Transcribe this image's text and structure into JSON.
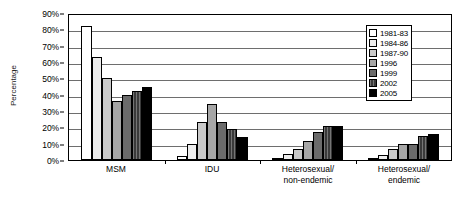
{
  "chart_data": {
    "type": "bar",
    "title": "",
    "xlabel": "",
    "ylabel": "Percentage",
    "ylim": [
      0,
      90
    ],
    "ytick_labels": [
      "90%",
      "80%",
      "70%",
      "60%",
      "50%",
      "40%",
      "30%",
      "20%",
      "10%",
      "0%"
    ],
    "ytick_values": [
      90,
      80,
      70,
      60,
      50,
      40,
      30,
      20,
      10,
      0
    ],
    "grid": true,
    "legend_position": "top-right",
    "categories": [
      "MSM",
      "IDU",
      "Heterosexual/non-endemic",
      "Heterosexual/endemic"
    ],
    "category_lines": [
      [
        "MSM",
        ""
      ],
      [
        "IDU",
        ""
      ],
      [
        "Heterosexual/",
        "non-endemic"
      ],
      [
        "Heterosexual/",
        "endemic"
      ]
    ],
    "series": [
      {
        "name": "1981-83",
        "color": "#ffffff",
        "values": [
          82,
          2.5,
          1,
          1.5
        ]
      },
      {
        "name": "1984-86",
        "color": "#ededed",
        "values": [
          63,
          10,
          3.5,
          3
        ]
      },
      {
        "name": "1987-90",
        "color": "#c9c9c9",
        "values": [
          50,
          23.5,
          6.5,
          6.5
        ]
      },
      {
        "name": "1996",
        "color": "#a6a6a6",
        "values": [
          36,
          34,
          11.5,
          10
        ]
      },
      {
        "name": "1999",
        "color": "#6b6b6b",
        "values": [
          40,
          23,
          17,
          10
        ]
      },
      {
        "name": "2002",
        "color": "#3a3a3a",
        "values": [
          42,
          19,
          21,
          14.5
        ]
      },
      {
        "name": "2005",
        "color": "#000000",
        "values": [
          45,
          14,
          21,
          16
        ]
      }
    ]
  }
}
